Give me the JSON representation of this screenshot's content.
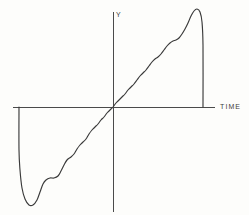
{
  "chart_data": {
    "type": "line",
    "title": "",
    "title_note": "clipped at top edge of image, illegible",
    "xlabel": "TIME",
    "ylabel": "Y",
    "grid": false,
    "legend": null,
    "axes": {
      "x_axis_label": "TIME",
      "y_axis_label": "Y",
      "x_range_px": [
        13,
        215
      ],
      "y_range_px": [
        12,
        212
      ],
      "origin_px": [
        113,
        107
      ],
      "ticks": [],
      "tick_labels": []
    },
    "series": [
      {
        "name": "waveform",
        "color": "#3a3a3a",
        "points": [
          [
            19,
            107
          ],
          [
            19,
            150
          ],
          [
            20,
            170
          ],
          [
            22,
            188
          ],
          [
            25,
            199
          ],
          [
            29,
            205
          ],
          [
            33,
            205
          ],
          [
            37,
            200
          ],
          [
            40,
            192
          ],
          [
            43,
            184
          ],
          [
            46,
            180
          ],
          [
            50,
            178
          ],
          [
            54,
            178
          ],
          [
            58,
            176
          ],
          [
            61,
            171
          ],
          [
            64,
            165
          ],
          [
            67,
            160
          ],
          [
            71,
            157
          ],
          [
            74,
            154
          ],
          [
            77,
            149
          ],
          [
            80,
            145
          ],
          [
            83,
            142
          ],
          [
            86,
            139
          ],
          [
            89,
            134
          ],
          [
            92,
            130
          ],
          [
            95,
            127
          ],
          [
            98,
            124
          ],
          [
            101,
            120
          ],
          [
            104,
            117
          ],
          [
            107,
            113
          ],
          [
            110,
            110
          ],
          [
            113,
            107
          ],
          [
            116,
            103
          ],
          [
            119,
            100
          ],
          [
            122,
            97
          ],
          [
            125,
            94
          ],
          [
            128,
            90
          ],
          [
            131,
            87
          ],
          [
            134,
            84
          ],
          [
            137,
            80
          ],
          [
            140,
            76
          ],
          [
            143,
            73
          ],
          [
            146,
            70
          ],
          [
            149,
            66
          ],
          [
            152,
            62
          ],
          [
            155,
            59
          ],
          [
            158,
            57
          ],
          [
            161,
            54
          ],
          [
            164,
            50
          ],
          [
            167,
            46
          ],
          [
            170,
            43
          ],
          [
            173,
            41
          ],
          [
            176,
            40
          ],
          [
            179,
            38
          ],
          [
            182,
            34
          ],
          [
            185,
            29
          ],
          [
            188,
            23
          ],
          [
            191,
            16
          ],
          [
            194,
            11
          ],
          [
            197,
            9
          ],
          [
            200,
            12
          ],
          [
            202,
            22
          ],
          [
            203,
            45
          ],
          [
            203,
            107
          ]
        ]
      }
    ]
  },
  "labels": {
    "time": "TIME",
    "y": "Y"
  }
}
